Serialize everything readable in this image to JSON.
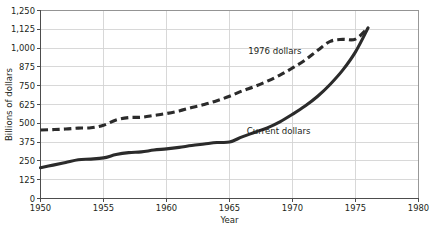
{
  "chart_data": {
    "type": "line",
    "title": "",
    "xlabel": "Year",
    "ylabel": "Billions of dollars",
    "xlim": [
      1950,
      1980
    ],
    "ylim": [
      0,
      1250
    ],
    "grid": true,
    "legend_position": "inline-annotations",
    "x_ticks": [
      "1950",
      "1955",
      "1960",
      "1965",
      "1970",
      "1975",
      "1980"
    ],
    "y_ticks": [
      "0",
      "125",
      "250",
      "375",
      "500",
      "625",
      "750",
      "875",
      "1,000",
      "1,125",
      "1,250"
    ],
    "series": [
      {
        "name": "1976 dollars",
        "style": "dashed",
        "color": "#2b2b2b",
        "x": [
          1950,
          1951,
          1952,
          1953,
          1954,
          1955,
          1956,
          1957,
          1958,
          1959,
          1960,
          1961,
          1962,
          1963,
          1964,
          1965,
          1966,
          1967,
          1968,
          1969,
          1970,
          1971,
          1972,
          1973,
          1974,
          1975,
          1976
        ],
        "values": [
          455,
          458,
          462,
          468,
          470,
          487,
          522,
          538,
          540,
          552,
          565,
          582,
          605,
          625,
          650,
          680,
          715,
          745,
          780,
          820,
          868,
          920,
          985,
          1045,
          1058,
          1060,
          1135
        ]
      },
      {
        "name": "Current dollars",
        "style": "solid",
        "color": "#2b2b2b",
        "x": [
          1950,
          1951,
          1952,
          1953,
          1954,
          1955,
          1956,
          1957,
          1958,
          1959,
          1960,
          1961,
          1962,
          1963,
          1964,
          1965,
          1966,
          1967,
          1968,
          1969,
          1970,
          1971,
          1972,
          1973,
          1974,
          1975,
          1976
        ],
        "values": [
          205,
          222,
          240,
          258,
          262,
          270,
          292,
          305,
          310,
          322,
          330,
          340,
          352,
          362,
          372,
          375,
          410,
          440,
          470,
          510,
          560,
          615,
          680,
          760,
          855,
          975,
          1135
        ]
      }
    ],
    "annotations": [
      {
        "text": "1976 dollars",
        "x": 1968.6,
        "y": 963
      },
      {
        "text": "Current dollars",
        "x": 1968.9,
        "y": 432
      }
    ]
  }
}
